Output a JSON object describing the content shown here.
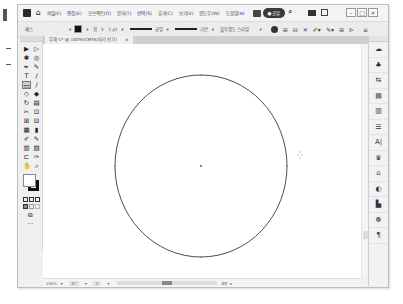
{
  "menubar": {
    "home_icon": "⌂",
    "items": [
      "파일(F)",
      "편집(E)",
      "오브젝트(O)",
      "문자(T)",
      "선택(S)",
      "효과(C)",
      "보기(V)",
      "윈도우(W)",
      "도움말(H)"
    ],
    "share_label": "공유",
    "share_icon": "person-icon",
    "search_icon": "⌕",
    "window_controls": {
      "minimize": "–",
      "maximize": "□",
      "close": "×"
    }
  },
  "control_bar": {
    "selection_label": "패스",
    "stroke_label": "획",
    "stroke_weight": "1 pt",
    "brush_label": "균일",
    "profile_label": "기본",
    "opacity_label": "불투명도 스타일",
    "icons": [
      "globe-icon",
      "align-icon",
      "transform-icon",
      "isolate-icon",
      "recolor-icon",
      "shape-icon",
      "grid-icon",
      "flag-icon",
      "menu-icon"
    ]
  },
  "document_tab": {
    "title": "무제-1* @ 100%(CMYK/미리 보기)",
    "close": "×"
  },
  "toolbar": {
    "tools": [
      "▶",
      "▷",
      "✱",
      "◎",
      "✒",
      "✎",
      "T",
      "∕",
      "▭",
      "∕",
      "◇",
      "◆",
      "↻",
      "▤",
      "✂",
      "⊡",
      "⊞",
      "⊟",
      "▦",
      "▮",
      "✐",
      "✎",
      "▥",
      "▧",
      "⊏",
      "✑",
      "✋",
      "⌕"
    ],
    "active_tool_index": 8,
    "more_label": "···"
  },
  "canvas": {
    "shape": "ellipse",
    "stroke_color": "#3a3a3a",
    "fill_color": "none"
  },
  "status_bar": {
    "zoom": "100%",
    "angle": "0°",
    "artboard": "1",
    "tool_name": "원형"
  },
  "dock": {
    "items": [
      "☁",
      "♣",
      "⇆",
      "▤",
      "▥",
      "☰",
      "A|",
      "♛",
      "⌂",
      "◐",
      "▙",
      "☸",
      "¶"
    ]
  }
}
